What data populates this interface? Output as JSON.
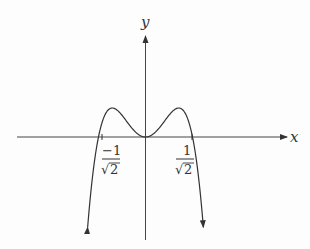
{
  "chart_data": {
    "type": "line",
    "title": "",
    "xlabel": "x",
    "ylabel": "y",
    "function": "y = 2x^2 - 4x^4",
    "roots": [
      "-1/√2",
      "0",
      "1/√2"
    ],
    "tick_labels": [
      {
        "x": -0.7071,
        "numerator": "−1",
        "denominator": "√2"
      },
      {
        "x": 0.7071,
        "numerator": "1",
        "denominator": "√2"
      }
    ],
    "local_maxima": [
      {
        "x": -0.5,
        "y": 0.25
      },
      {
        "x": 0.5,
        "y": 0.25
      }
    ],
    "local_minimum": {
      "x": 0,
      "y": 0
    },
    "end_behavior": "both ends go to -∞ (arrows pointing down)",
    "grid": false
  },
  "axes": {
    "x_label": "x",
    "y_label": "y"
  },
  "ticks": {
    "left": {
      "num": "−1",
      "den": "2",
      "root": "√"
    },
    "right": {
      "num": "1",
      "den": "2",
      "root": "√"
    }
  }
}
